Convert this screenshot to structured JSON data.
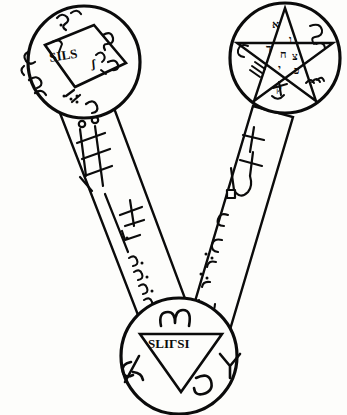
{
  "figure": {
    "background_color": "#fdfdfb",
    "ink_color": "#0b0b0b"
  },
  "discs": [
    {
      "id": "upper-left-disc",
      "name": "square-disc",
      "cx": 84,
      "cy": 62,
      "r": 56,
      "inner_figure": "tilted-square",
      "inner_inscription": "SILS",
      "inner_inscription_extra": "ʃ",
      "rim_glyphs": [
        "ʃ",
        "Ƨ",
        "ʅ",
        "ε",
        "ω",
        "ʅ",
        "·/·:",
        "ʅ"
      ]
    },
    {
      "id": "upper-right-disc",
      "name": "pentagram-disc",
      "cx": 285,
      "cy": 58,
      "r": 55,
      "inner_figure": "pentagram",
      "inner_glyphs": [
        "א",
        "ו",
        "ד",
        "ח",
        "צ",
        "י",
        "כ",
        "ק"
      ],
      "rim_glyphs": [
        "י",
        "ו",
        "ק",
        "צ",
        "נ"
      ]
    },
    {
      "id": "lower-disc",
      "name": "triangle-disc",
      "cx": 179,
      "cy": 356,
      "r": 58,
      "inner_figure": "inverted-triangle",
      "inner_inscription": "SLIΓSI",
      "rim_glyphs": [
        "ω",
        "ж",
        "Ү",
        "ʅ"
      ]
    }
  ],
  "bands": [
    {
      "id": "left-band",
      "name": "left-connecting-band",
      "from": "upper-left-disc",
      "to": "lower-disc",
      "sigils": [
        "ladder-sigil",
        "cross-sigil"
      ],
      "script": "ʃʃʃʃʃ"
    },
    {
      "id": "right-band",
      "name": "right-connecting-band",
      "from": "upper-right-disc",
      "to": "lower-disc",
      "sigils": [
        "anchor-cross-sigil"
      ],
      "script": "ʃʃʃʃ"
    }
  ]
}
